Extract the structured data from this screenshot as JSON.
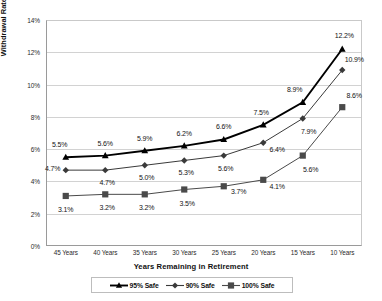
{
  "chart_data": {
    "type": "line",
    "title": "",
    "xlabel": "Years Remaining in Retirement",
    "ylabel": "Withdrawal Rates",
    "categories": [
      "45 Years",
      "40 Years",
      "35 Years",
      "30 Years",
      "25 Years",
      "20 Years",
      "15 Years",
      "10 Years"
    ],
    "ylim": [
      0,
      14
    ],
    "yticks": [
      "0%",
      "2%",
      "4%",
      "6%",
      "8%",
      "10%",
      "12%",
      "14%"
    ],
    "ytick_values": [
      0,
      2,
      4,
      6,
      8,
      10,
      12,
      14
    ],
    "grid": true,
    "legend_position": "bottom",
    "series": [
      {
        "name": "95% Safe",
        "marker": "triangle",
        "color": "#000000",
        "values": [
          5.5,
          5.6,
          5.9,
          6.2,
          6.6,
          7.5,
          8.9,
          12.2
        ],
        "labels": [
          "5.5%",
          "5.6%",
          "5.9%",
          "6.2%",
          "6.6%",
          "7.5%",
          "8.9%",
          "12.2%"
        ]
      },
      {
        "name": "90% Safe",
        "marker": "diamond",
        "color": "#3a3a3a",
        "values": [
          4.7,
          4.7,
          5.0,
          5.3,
          5.6,
          6.4,
          7.9,
          10.9
        ],
        "labels": [
          "4.7%",
          "4.7%",
          "5.0%",
          "5.3%",
          "5.6%",
          "6.4%",
          "7.9%",
          "10.9%"
        ]
      },
      {
        "name": "100% Safe",
        "marker": "square",
        "color": "#4a4a4a",
        "values": [
          3.1,
          3.2,
          3.2,
          3.5,
          3.7,
          4.1,
          5.6,
          8.6
        ],
        "labels": [
          "3.1%",
          "3.2%",
          "3.2%",
          "3.5%",
          "3.7%",
          "4.1%",
          "5.6%",
          "8.6%"
        ]
      }
    ]
  }
}
